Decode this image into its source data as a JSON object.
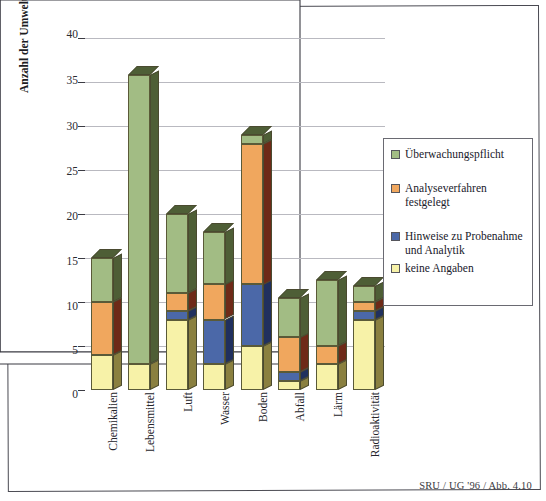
{
  "figure": {
    "caption": "SRU / UG '96 / Abb. 4.10"
  },
  "chart_data": {
    "type": "bar",
    "subtype": "stacked-3d-column",
    "title": "",
    "xlabel": "",
    "ylabel": "Anzahl der Umweltstandardlisten",
    "ylim": [
      0,
      40
    ],
    "ytick_values": [
      0,
      5,
      10,
      15,
      20,
      25,
      30,
      35,
      40
    ],
    "ytick_labels": [
      "0",
      "5",
      "10",
      "15",
      "20",
      "25",
      "30",
      "35",
      "40"
    ],
    "grid": true,
    "grid_axis": "y",
    "legend_position": "right",
    "categories": [
      "Chemikalien",
      "Lebensmittel",
      "Luft",
      "Wasser",
      "Boden",
      "Abfall",
      "Lärm",
      "Radioaktivität"
    ],
    "series": [
      {
        "name": "keine Angaben",
        "color": "#F7F2A8",
        "values": [
          4,
          3,
          8,
          3,
          5,
          1,
          3,
          8
        ]
      },
      {
        "name": "Hinweise zu Probenahme und Analytik",
        "color": "#4B68A8",
        "values": [
          0,
          0,
          1,
          5,
          7,
          1,
          0,
          1
        ]
      },
      {
        "name": "Analyseverfahren festgelegt",
        "color": "#F0A75E",
        "values": [
          6,
          0,
          2,
          4,
          16,
          4,
          2,
          1
        ]
      },
      {
        "name": "Überwachungspflicht",
        "color": "#A2BC84",
        "values": [
          5,
          32.8,
          9,
          6,
          1,
          4.5,
          7.5,
          1.8
        ]
      }
    ],
    "totals": [
      15,
      35.8,
      20,
      18,
      29,
      10.5,
      12.5,
      11.8
    ]
  },
  "legend": {
    "items": [
      {
        "label": "Überwachungspflicht",
        "color": "#A2BC84"
      },
      {
        "label": "Analyseverfahren festgelegt",
        "color": "#F0A75E"
      },
      {
        "label": "Hinweise zu Probenahme und Analytik",
        "color": "#4B68A8"
      },
      {
        "label": "keine Angaben",
        "color": "#F7F2A8"
      }
    ]
  },
  "colors": {
    "green": "#A2BC84",
    "green_side": "#4E5E36",
    "orange": "#F0A75E",
    "orange_side": "#6E2A18",
    "blue": "#4B68A8",
    "blue_side": "#20305E",
    "yellow": "#F7F2A8",
    "yellow_side": "#8A8040",
    "axis": "#3A3A42",
    "grid": "#B9B9C0"
  }
}
